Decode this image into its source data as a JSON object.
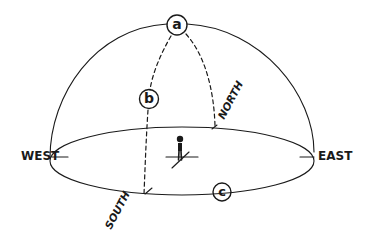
{
  "diagram": {
    "colors": {
      "ink": "#1a1a1a",
      "background": "#ffffff"
    },
    "directions": {
      "west": "WEST",
      "east": "EAST",
      "north": "NORTH",
      "south": "SOUTH"
    },
    "markers": {
      "a": "a",
      "b": "b",
      "c": "c"
    },
    "elements": [
      {
        "id": "dome",
        "type": "hemisphere-outline",
        "style": "solid"
      },
      {
        "id": "horizon",
        "type": "ellipse",
        "style": "solid"
      },
      {
        "id": "meridian-south",
        "type": "arc",
        "from": "a",
        "to": "SOUTH",
        "via": "b",
        "style": "dashed"
      },
      {
        "id": "meridian-north",
        "type": "arc",
        "from": "a",
        "to": "NORTH",
        "style": "dashed"
      },
      {
        "id": "observer",
        "type": "stick-figure",
        "position": "center of horizon"
      }
    ]
  }
}
